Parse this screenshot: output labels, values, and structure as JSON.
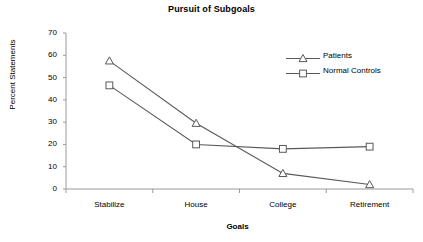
{
  "chart_data": {
    "type": "line",
    "title": "Pursuit of Subgoals",
    "xlabel": "Goals",
    "ylabel": "Percent Statements",
    "categories": [
      "Stabilize",
      "House",
      "College",
      "Retirement"
    ],
    "ylim": [
      0,
      70
    ],
    "yticks": [
      0,
      10,
      20,
      30,
      40,
      50,
      60,
      70
    ],
    "grid": false,
    "legend_position": "top-right",
    "series": [
      {
        "name": "Patients",
        "marker": "triangle",
        "color": "#595959",
        "values": [
          57.5,
          29.5,
          7,
          2
        ]
      },
      {
        "name": "Normal Controls",
        "marker": "square",
        "color": "#595959",
        "values": [
          46.5,
          20,
          18,
          19
        ]
      }
    ]
  }
}
